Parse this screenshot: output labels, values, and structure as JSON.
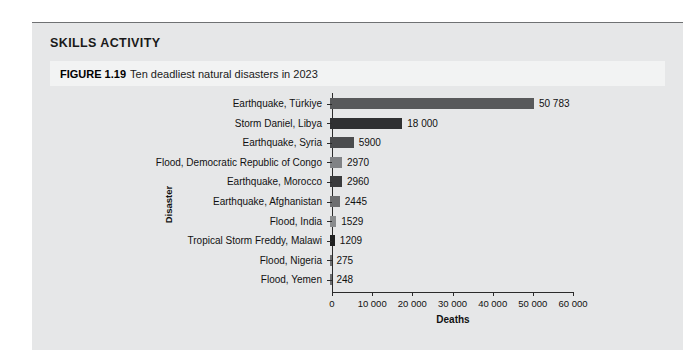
{
  "panel": {
    "section_title": "SKILLS ACTIVITY",
    "figure_number": "FIGURE 1.19",
    "figure_caption": "Ten deadliest natural disasters in 2023",
    "background_color": "#e6e7e8",
    "caption_band_color": "#f2f3f3"
  },
  "chart_data": {
    "type": "bar",
    "orientation": "horizontal",
    "title": "Ten deadliest natural disasters in 2023",
    "xlabel": "Deaths",
    "ylabel": "Disaster",
    "grid": false,
    "legend": false,
    "xlim": [
      0,
      60000
    ],
    "xticks": [
      0,
      10000,
      20000,
      30000,
      40000,
      50000,
      60000
    ],
    "xtick_labels": [
      "0",
      "10 000",
      "20 000",
      "30 000",
      "40 000",
      "50 000",
      "60 000"
    ],
    "categories": [
      "Earthquake, Türkiye",
      "Storm Daniel, Libya",
      "Earthquake, Syria",
      "Flood, Democratic Republic of Congo",
      "Earthquake, Morocco",
      "Earthquake, Afghanistan",
      "Flood, India",
      "Tropical Storm Freddy, Malawi",
      "Flood, Nigeria",
      "Flood, Yemen"
    ],
    "values": [
      50783,
      18000,
      5900,
      2970,
      2960,
      2445,
      1529,
      1209,
      275,
      248
    ],
    "value_labels": [
      "50 783",
      "18 000",
      "5900",
      "2970",
      "2960",
      "2445",
      "1529",
      "1209",
      "275",
      "248"
    ],
    "bar_colors": [
      "#58595b",
      "#2f3032",
      "#4b4c4e",
      "#808285",
      "#3a3b3d",
      "#6d6e70",
      "#8a8c8e",
      "#1f2021",
      "#6d6e70",
      "#6d6e70"
    ]
  }
}
